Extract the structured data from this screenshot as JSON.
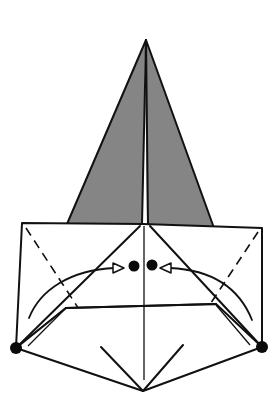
{
  "diagram": {
    "type": "origami-fold-step",
    "colors": {
      "paper_back": "#858585",
      "paper_front": "#ffffff",
      "line": "#111111",
      "background": "#ffffff"
    },
    "elements": [
      {
        "name": "top-kite",
        "shade": "gray"
      },
      {
        "name": "white-rectangle-flap",
        "shade": "white"
      },
      {
        "name": "left-gray-triangle",
        "shade": "gray"
      },
      {
        "name": "right-gray-triangle",
        "shade": "gray"
      },
      {
        "name": "bottom-diamond",
        "shade": "white"
      },
      {
        "name": "valley-fold-lines",
        "style": "dashed",
        "count": 2
      },
      {
        "name": "fold-arrows",
        "count": 2,
        "direction": "toward-center"
      },
      {
        "name": "reference-dots",
        "count": 4
      }
    ],
    "instruction_text": ""
  }
}
